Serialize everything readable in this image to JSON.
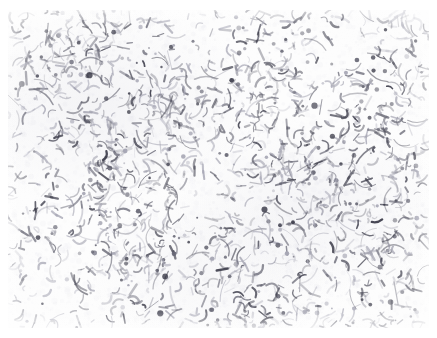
{
  "image": {
    "kind": "light-microscopy-micrograph",
    "subject_label": "bacterial smear",
    "description": "Bright-field micrograph of a stained bacterial smear: dense field of small dark rod-shaped and comma/curved bacilli scattered randomly over a pale, nearly white background.",
    "width_px": 437,
    "height_px": 338,
    "margin": {
      "top_px": 10,
      "right_px": 8,
      "bottom_px": 10,
      "left_px": 8
    },
    "field": {
      "width_px": 421,
      "height_px": 318
    },
    "background_color": "#fdfdfd",
    "paper_color": "#ffffff",
    "organism_color": "#6b6b78",
    "organism_color_dark": "#3e3e4c",
    "organism_color_light": "#a9a9b6",
    "haze_color": "#e2e2ea",
    "morphology": [
      "short-rod",
      "curved-rod",
      "comma",
      "coccoid-dot",
      "filament",
      "pair"
    ],
    "approx_organism_count": 1700,
    "organism_length_px_range": [
      3,
      13
    ],
    "organism_width_px_range": [
      1,
      2.4
    ],
    "density_hotspots": [
      {
        "cx_pct": 16,
        "cy_pct": 14,
        "r_pct": 13
      },
      {
        "cx_pct": 22,
        "cy_pct": 50,
        "r_pct": 15
      },
      {
        "cx_pct": 40,
        "cy_pct": 33,
        "r_pct": 14
      },
      {
        "cx_pct": 31,
        "cy_pct": 76,
        "r_pct": 15
      },
      {
        "cx_pct": 62,
        "cy_pct": 22,
        "r_pct": 13
      },
      {
        "cx_pct": 72,
        "cy_pct": 55,
        "r_pct": 14
      },
      {
        "cx_pct": 56,
        "cy_pct": 88,
        "r_pct": 12
      },
      {
        "cx_pct": 88,
        "cy_pct": 36,
        "r_pct": 11
      },
      {
        "cx_pct": 86,
        "cy_pct": 80,
        "r_pct": 11
      }
    ],
    "sparse_zones": [
      {
        "cx_pct": 50,
        "cy_pct": 10,
        "r_pct": 10
      },
      {
        "cx_pct": 78,
        "cy_pct": 12,
        "r_pct": 8
      },
      {
        "cx_pct": 47,
        "cy_pct": 58,
        "r_pct": 9
      },
      {
        "cx_pct": 8,
        "cy_pct": 90,
        "r_pct": 8
      }
    ],
    "render_seed": 20240617,
    "scale_bar": null,
    "annotations": [],
    "overlay_text": []
  }
}
